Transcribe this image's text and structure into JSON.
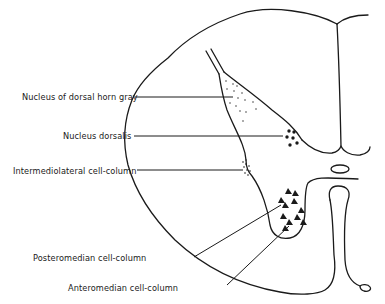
{
  "diagram": {
    "labels": [
      {
        "id": "nucleus-dorsal-horn-gray",
        "text": "Nucleus of dorsal horn gray",
        "x": 22,
        "y": 92
      },
      {
        "id": "nucleus-dorsalis",
        "text": "Nucleus dorsalis",
        "x": 63,
        "y": 131
      },
      {
        "id": "intermediolateral",
        "text": "Intermediolateral cell-column",
        "x": 13,
        "y": 166
      },
      {
        "id": "posteromedian",
        "text": "Posteromedian cell-column",
        "x": 33,
        "y": 253
      },
      {
        "id": "anteromedian",
        "text": "Anteromedian cell-column",
        "x": 68,
        "y": 283
      }
    ],
    "colors": {
      "ink": "#1a1a1a",
      "background": "#ffffff"
    }
  }
}
